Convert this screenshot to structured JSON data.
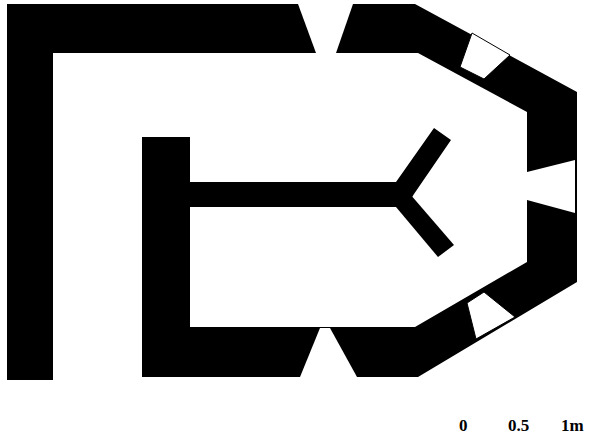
{
  "diagram": {
    "type": "architectural-floor-plan",
    "wall_color": "#000000",
    "background": "#ffffff",
    "openings": [
      "top-window",
      "upper-right-window",
      "right-window",
      "lower-right-window",
      "bottom-window"
    ]
  },
  "scale_bar": {
    "labels": [
      "0",
      "0.5",
      "1m"
    ]
  }
}
